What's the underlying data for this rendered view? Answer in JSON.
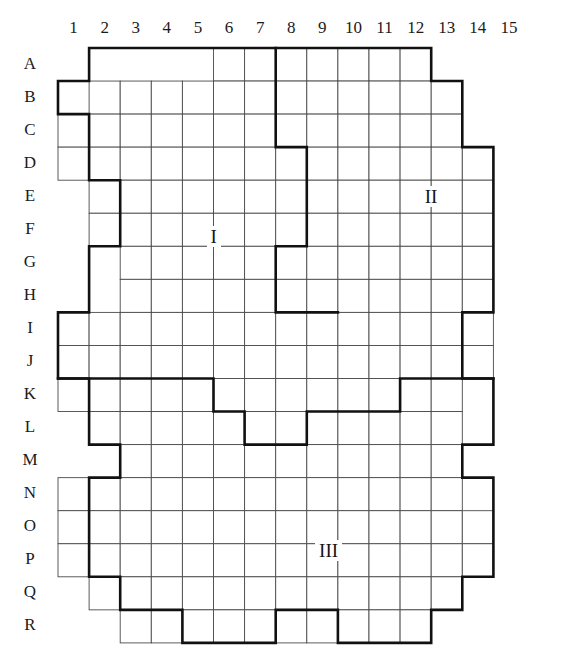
{
  "figure": {
    "title": "",
    "kind": "grid-partition-diagram",
    "grid": {
      "cols": 15,
      "rows": 18,
      "origin_x": 58,
      "origin_y": 48,
      "cell_w": 31.1,
      "cell_h": 33.05,
      "thin_line_color": "#4a4a4a",
      "thick_line_color": "#111111",
      "thin_line_width": 0.9,
      "thick_line_width": 2.6,
      "background": "#ffffff"
    },
    "column_labels": [
      "1",
      "2",
      "3",
      "4",
      "5",
      "6",
      "7",
      "8",
      "9",
      "10",
      "11",
      "12",
      "13",
      "14",
      "15"
    ],
    "row_labels": [
      "A",
      "B",
      "C",
      "D",
      "E",
      "F",
      "G",
      "H",
      "I",
      "J",
      "K",
      "L",
      "M",
      "N",
      "O",
      "P",
      "Q",
      "R"
    ],
    "region_labels": [
      {
        "name": "region-label-i",
        "text": "I",
        "col": 4.5,
        "row": 5.2
      },
      {
        "name": "region-label-ii",
        "text": "II",
        "row": 4.0,
        "col": 11.5
      },
      {
        "name": "region-label-iii",
        "text": "III",
        "col": 8.2,
        "row": 14.7
      }
    ],
    "cells": {
      "A": [
        6,
        7,
        8,
        9,
        10,
        11,
        12
      ],
      "B": [
        2,
        3,
        4,
        5,
        6,
        7,
        8,
        9,
        10,
        11,
        12,
        13
      ],
      "C": [
        1,
        2,
        3,
        4,
        5,
        6,
        7,
        8,
        9,
        10,
        11,
        12,
        13
      ],
      "D": [
        1,
        2,
        3,
        4,
        5,
        6,
        7,
        8,
        9,
        10,
        11,
        12,
        13,
        14
      ],
      "E": [
        2,
        3,
        4,
        5,
        6,
        7,
        8,
        9,
        10,
        11,
        12,
        13,
        14
      ],
      "F": [
        2,
        3,
        4,
        5,
        6,
        7,
        8,
        9,
        10,
        11,
        12,
        13,
        14
      ],
      "G": [
        3,
        4,
        5,
        6,
        7,
        8,
        9,
        10,
        11,
        12,
        13,
        14
      ],
      "H": [
        3,
        4,
        5,
        6,
        7,
        8,
        9,
        10,
        11,
        12,
        13,
        14
      ],
      "I": [
        1,
        2,
        3,
        4,
        5,
        6,
        7,
        8,
        9,
        10,
        11,
        12,
        13,
        14
      ],
      "J": [
        1,
        2,
        3,
        4,
        5,
        6,
        7,
        8,
        9,
        10,
        11,
        12,
        13,
        14
      ],
      "K": [
        1,
        2,
        3,
        4,
        5,
        6,
        7,
        8,
        9,
        10,
        11,
        12,
        13
      ],
      "L": [
        2,
        3,
        4,
        5,
        6,
        7,
        8,
        9,
        10,
        11,
        12,
        13
      ],
      "M": [
        3,
        4,
        5,
        6,
        7,
        8,
        9,
        10,
        11,
        12,
        13
      ],
      "N": [
        1,
        2,
        3,
        4,
        5,
        6,
        7,
        8,
        9,
        10,
        11,
        12,
        13
      ],
      "O": [
        1,
        2,
        3,
        4,
        5,
        6,
        7,
        8,
        9,
        10,
        11,
        12,
        13,
        14
      ],
      "P": [
        1,
        2,
        3,
        4,
        5,
        6,
        7,
        8,
        9,
        10,
        11,
        12,
        13,
        14
      ],
      "Q": [
        2,
        3,
        4,
        5,
        6,
        7,
        8,
        9,
        10,
        11,
        12,
        13
      ],
      "R": [
        3,
        4,
        5,
        6,
        7,
        8,
        9,
        10,
        11,
        12
      ]
    },
    "outer_boundary": [
      [
        5,
        0
      ],
      [
        12,
        0
      ],
      [
        12,
        1
      ],
      [
        13,
        1
      ],
      [
        13,
        3
      ],
      [
        14,
        3
      ],
      [
        14,
        8
      ],
      [
        13,
        8
      ],
      [
        13,
        10
      ],
      [
        14,
        10
      ],
      [
        14,
        12
      ],
      [
        13,
        12
      ],
      [
        13,
        13
      ],
      [
        14,
        13
      ],
      [
        14,
        16
      ],
      [
        13,
        16
      ],
      [
        13,
        17
      ],
      [
        12,
        17
      ],
      [
        12,
        18
      ],
      [
        9,
        18
      ],
      [
        9,
        17
      ],
      [
        7,
        17
      ],
      [
        7,
        18
      ],
      [
        4,
        18
      ],
      [
        4,
        17
      ],
      [
        2,
        17
      ],
      [
        2,
        16
      ],
      [
        1,
        16
      ],
      [
        1,
        13
      ],
      [
        2,
        13
      ],
      [
        2,
        12
      ],
      [
        1,
        12
      ],
      [
        1,
        10
      ],
      [
        0,
        10
      ],
      [
        0,
        8
      ],
      [
        1,
        8
      ],
      [
        1,
        6
      ],
      [
        2,
        6
      ],
      [
        2,
        4
      ],
      [
        1,
        4
      ],
      [
        1,
        2
      ],
      [
        0,
        2
      ],
      [
        0,
        1
      ],
      [
        1,
        1
      ],
      [
        1,
        0
      ],
      [
        5,
        0
      ]
    ],
    "divider_i_ii": [
      [
        7,
        0
      ],
      [
        7,
        3
      ],
      [
        8,
        3
      ],
      [
        8,
        6
      ],
      [
        7,
        6
      ],
      [
        7,
        8
      ],
      [
        9,
        8
      ]
    ],
    "divider_i_iii": [
      [
        0,
        10
      ],
      [
        5,
        10
      ],
      [
        5,
        11
      ],
      [
        6,
        11
      ],
      [
        6,
        12
      ],
      [
        8,
        12
      ],
      [
        8,
        11
      ],
      [
        11,
        11
      ],
      [
        11,
        10
      ],
      [
        14,
        10
      ]
    ]
  }
}
